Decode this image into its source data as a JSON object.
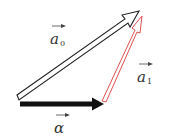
{
  "diagram": {
    "type": "vector-triangle",
    "colors": {
      "background": "#ffffff",
      "vector_alpha_fill": "#111111",
      "vector_a0_stroke": "#222222",
      "vector_a0_fill": "#ffffff",
      "vector_a1_stroke": "#e05050",
      "vector_a1_fill": "#ffffff",
      "label_color": "#333333"
    },
    "vectors": [
      {
        "id": "alpha",
        "style": "solid-black",
        "from": [
          20,
          104
        ],
        "to": [
          104,
          104
        ]
      },
      {
        "id": "a0",
        "style": "hollow-black-outline",
        "from": [
          18,
          97
        ],
        "to": [
          138,
          12
        ]
      },
      {
        "id": "a1",
        "style": "hollow-red-outline",
        "from": [
          104,
          100
        ],
        "to": [
          142,
          17
        ]
      }
    ],
    "labels": {
      "a0": {
        "symbol": "a",
        "subscript": "0"
      },
      "a1": {
        "symbol": "a",
        "subscript": "1"
      },
      "alpha": {
        "symbol": "α",
        "subscript": ""
      }
    }
  }
}
